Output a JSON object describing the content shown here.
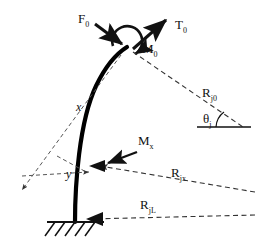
{
  "figure": {
    "type": "engineering-free-body-diagram",
    "colors": {
      "stroke": "#111111",
      "beam": "#000000",
      "dashed": "#444444",
      "background": "#ffffff"
    }
  },
  "labels": {
    "tip_force": {
      "base": "F",
      "sub": "0"
    },
    "tip_tension": {
      "base": "T",
      "sub": "0"
    },
    "tip_moment": {
      "base": "M",
      "sub": "0"
    },
    "section_moment": {
      "base": "M",
      "sub": "x"
    },
    "coord_x": {
      "base": "x",
      "sub": ""
    },
    "coord_y": {
      "base": "y",
      "sub": ""
    },
    "range_top": {
      "base": "R",
      "sub": "j0"
    },
    "range_mid": {
      "base": "R",
      "sub": "jx"
    },
    "range_base": {
      "base": "R",
      "sub": "jL"
    },
    "angle": {
      "base": "θ",
      "sub": "j"
    }
  },
  "geometry": {
    "beam_tip": [
      127,
      47
    ],
    "beam_base": [
      75,
      222
    ],
    "support_y": 222,
    "angle_vertex": [
      243,
      127
    ],
    "notes": "beam curves convex-left from base to tip"
  }
}
